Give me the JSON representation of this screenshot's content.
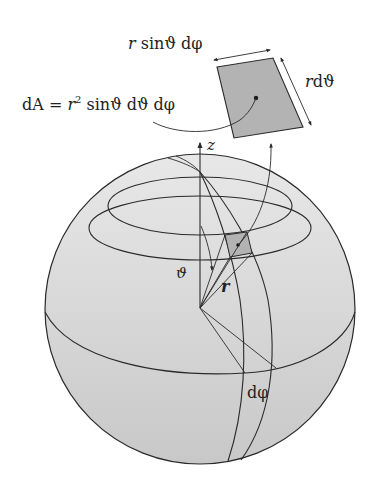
{
  "diagram": {
    "labels": {
      "width_label_r": "r",
      "width_label_rest": " sinϑ dφ",
      "height_label_r": "r",
      "height_label_rest": "dϑ",
      "area_formula_lhs": "dA = ",
      "area_formula_r": "r",
      "area_formula_exp": "2",
      "area_formula_rest": " sinϑ dϑ dφ",
      "axis_z": "z",
      "polar_angle": "ϑ",
      "radius": "r",
      "azimuth_increment": "dφ"
    },
    "colors": {
      "sphere_top": "#e6e6e6",
      "sphere_bottom": "#c8c8c8",
      "patch": "#b3b3b3",
      "stroke": "#2a2a2a",
      "background": "#ffffff"
    },
    "geometry": {
      "sphere": {
        "cx": 200,
        "cy": 309,
        "r": 155
      },
      "pole": {
        "x": 200,
        "y": 172
      },
      "origin": {
        "x": 200,
        "y": 308
      }
    }
  }
}
